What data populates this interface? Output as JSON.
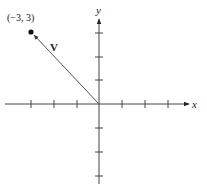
{
  "diagram": {
    "type": "vector-on-cartesian-plane",
    "axes": {
      "x_label": "x",
      "y_label": "y",
      "x_ticks": [
        -3,
        -2,
        -1,
        1,
        2,
        3
      ],
      "y_ticks": [
        -3,
        -2,
        -1,
        1,
        2,
        3
      ]
    },
    "vector": {
      "name": "V",
      "tail": [
        0,
        0
      ],
      "head": [
        -3,
        3
      ]
    },
    "point": {
      "label": "(−3, 3)",
      "coords": [
        -3,
        3
      ]
    },
    "colors": {
      "axis": "#333333",
      "vector": "#555555",
      "point": "#111111"
    }
  }
}
